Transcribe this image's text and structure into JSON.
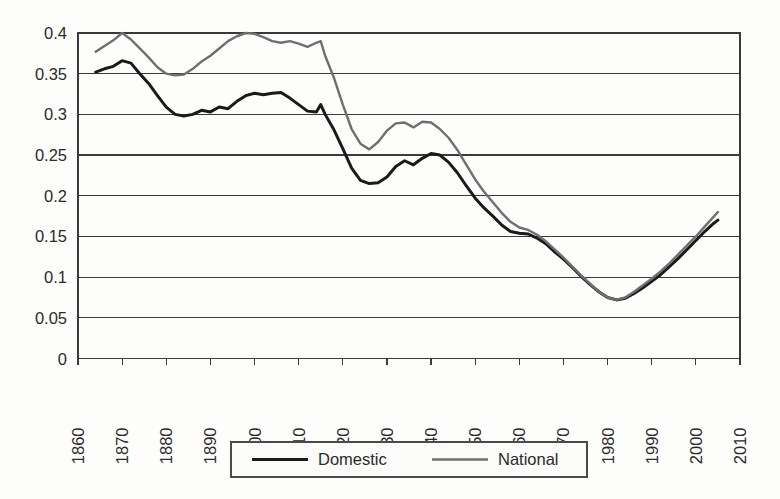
{
  "chart_data": {
    "type": "line",
    "title": "",
    "xlabel": "",
    "ylabel": "",
    "xlim": [
      1860,
      2010
    ],
    "ylim": [
      0,
      0.4
    ],
    "grid": true,
    "legend_position": "bottom-center",
    "x_ticks": [
      "1860",
      "1870",
      "1880",
      "1890",
      "1900",
      "1910",
      "1920",
      "1930",
      "1940",
      "1950",
      "1960",
      "1970",
      "1980",
      "1990",
      "2000",
      "2010"
    ],
    "y_ticks": [
      "0",
      "0.05",
      "0.1",
      "0.15",
      "0.2",
      "0.25",
      "0.3",
      "0.35",
      "0.4"
    ],
    "series": [
      {
        "name": "Domestic",
        "color": "#1a1a1a",
        "width": 3.0,
        "x": [
          1864,
          1866,
          1868,
          1870,
          1872,
          1874,
          1876,
          1878,
          1880,
          1882,
          1884,
          1886,
          1888,
          1890,
          1892,
          1894,
          1896,
          1898,
          1900,
          1902,
          1904,
          1906,
          1908,
          1910,
          1912,
          1914,
          1915,
          1916,
          1918,
          1920,
          1922,
          1924,
          1926,
          1928,
          1930,
          1932,
          1934,
          1936,
          1938,
          1940,
          1942,
          1944,
          1946,
          1948,
          1950,
          1952,
          1954,
          1956,
          1958,
          1960,
          1962,
          1964,
          1966,
          1968,
          1970,
          1972,
          1974,
          1976,
          1978,
          1980,
          1982,
          1984,
          1986,
          1988,
          1990,
          1992,
          1994,
          1996,
          1998,
          2000,
          2002,
          2004,
          2005
        ],
        "y": [
          0.352,
          0.356,
          0.359,
          0.366,
          0.363,
          0.35,
          0.338,
          0.323,
          0.309,
          0.3,
          0.298,
          0.3,
          0.305,
          0.303,
          0.309,
          0.307,
          0.316,
          0.323,
          0.326,
          0.324,
          0.326,
          0.327,
          0.32,
          0.312,
          0.304,
          0.303,
          0.312,
          0.3,
          0.281,
          0.258,
          0.234,
          0.219,
          0.215,
          0.216,
          0.223,
          0.236,
          0.243,
          0.238,
          0.246,
          0.252,
          0.25,
          0.241,
          0.228,
          0.212,
          0.197,
          0.185,
          0.175,
          0.164,
          0.156,
          0.154,
          0.153,
          0.148,
          0.141,
          0.131,
          0.122,
          0.112,
          0.101,
          0.091,
          0.082,
          0.075,
          0.072,
          0.074,
          0.08,
          0.087,
          0.095,
          0.103,
          0.113,
          0.123,
          0.134,
          0.145,
          0.156,
          0.166,
          0.17
        ]
      },
      {
        "name": "National",
        "color": "#6f6f6f",
        "width": 2.4,
        "x": [
          1864,
          1866,
          1868,
          1870,
          1872,
          1874,
          1876,
          1878,
          1880,
          1882,
          1884,
          1886,
          1888,
          1890,
          1892,
          1894,
          1896,
          1898,
          1900,
          1902,
          1904,
          1906,
          1908,
          1910,
          1912,
          1914,
          1915,
          1916,
          1918,
          1920,
          1922,
          1924,
          1926,
          1928,
          1930,
          1932,
          1934,
          1936,
          1938,
          1940,
          1942,
          1944,
          1946,
          1948,
          1950,
          1952,
          1954,
          1956,
          1958,
          1960,
          1962,
          1964,
          1966,
          1968,
          1970,
          1972,
          1974,
          1976,
          1978,
          1980,
          1982,
          1984,
          1986,
          1988,
          1990,
          1992,
          1994,
          1996,
          1998,
          2000,
          2002,
          2004,
          2005
        ],
        "y": [
          0.377,
          0.384,
          0.391,
          0.4,
          0.392,
          0.381,
          0.37,
          0.358,
          0.35,
          0.348,
          0.349,
          0.356,
          0.365,
          0.372,
          0.381,
          0.39,
          0.396,
          0.4,
          0.399,
          0.395,
          0.39,
          0.388,
          0.39,
          0.387,
          0.383,
          0.388,
          0.39,
          0.372,
          0.345,
          0.312,
          0.282,
          0.264,
          0.257,
          0.266,
          0.28,
          0.289,
          0.29,
          0.284,
          0.291,
          0.29,
          0.282,
          0.271,
          0.256,
          0.238,
          0.22,
          0.205,
          0.192,
          0.179,
          0.168,
          0.161,
          0.158,
          0.152,
          0.144,
          0.134,
          0.124,
          0.113,
          0.102,
          0.092,
          0.082,
          0.075,
          0.072,
          0.075,
          0.082,
          0.09,
          0.098,
          0.107,
          0.117,
          0.128,
          0.139,
          0.15,
          0.162,
          0.174,
          0.18
        ]
      }
    ]
  },
  "legend": {
    "items": [
      {
        "label": "Domestic",
        "color": "#1a1a1a"
      },
      {
        "label": "National",
        "color": "#6f6f6f"
      }
    ]
  }
}
